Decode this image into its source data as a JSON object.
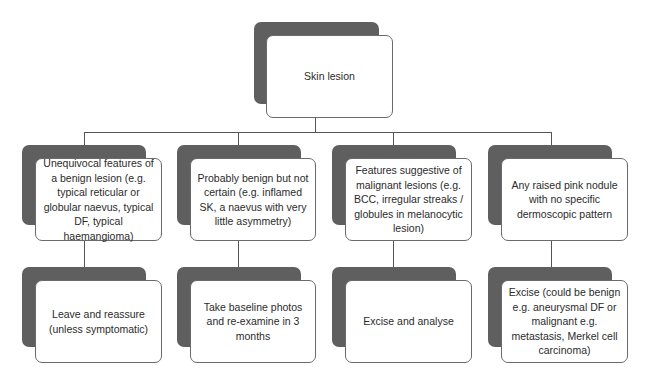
{
  "root": {
    "label": "Skin lesion"
  },
  "categories": [
    {
      "label": "Unequivocal features of a benign lesion (e.g. typical reticular or globular naevus, typical DF, typical haemangioma)"
    },
    {
      "label": "Probably benign but not certain (e.g. inflamed SK, a naevus with very little asymmetry)"
    },
    {
      "label": "Features suggestive of malignant lesions (e.g. BCC, irregular streaks / globules in melanocytic lesion)"
    },
    {
      "label": "Any raised pink nodule with no specific dermoscopic pattern"
    }
  ],
  "actions": [
    {
      "label": "Leave and reassure (unless symptomatic)"
    },
    {
      "label": "Take baseline photos and re-examine in 3 months"
    },
    {
      "label": "Excise and analyse"
    },
    {
      "label": "Excise (could be benign e.g. aneurysmal DF or malignant e.g. metastasis, Merkel cell carcinoma)"
    }
  ],
  "colors": {
    "shadow": "#5f5f5f",
    "border": "#6a6a6a",
    "connector": "#555555",
    "text": "#2b2b2b"
  }
}
